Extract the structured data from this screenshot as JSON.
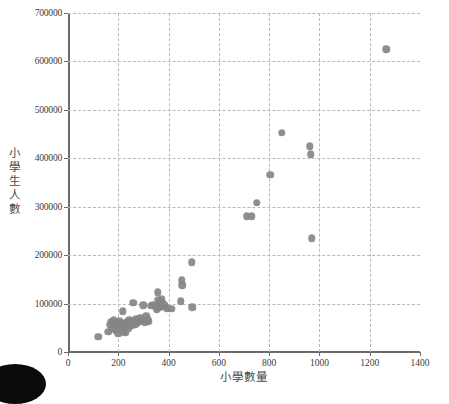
{
  "chart_data": {
    "type": "scatter",
    "title": "",
    "xlabel": "小學數量",
    "ylabel": "小學生人數",
    "xlim": [
      0,
      1400
    ],
    "ylim": [
      0,
      700000
    ],
    "grid": true,
    "legend": null,
    "marker_color": "#868686",
    "xticks": [
      "0",
      "200",
      "400",
      "600",
      "800",
      "1000",
      "1200",
      "1400"
    ],
    "xtick_values": [
      0,
      200,
      400,
      600,
      800,
      1000,
      1200,
      1400
    ],
    "yticks": [
      "0",
      "100000",
      "200000",
      "300000",
      "400000",
      "500000",
      "600000",
      "700000"
    ],
    "ytick_values": [
      0,
      100000,
      200000,
      300000,
      400000,
      500000,
      600000,
      700000
    ],
    "points": [
      [
        120,
        31000
      ],
      [
        160,
        42000
      ],
      [
        168,
        56000
      ],
      [
        172,
        62000
      ],
      [
        176,
        48000
      ],
      [
        180,
        58000
      ],
      [
        182,
        66000
      ],
      [
        186,
        52000
      ],
      [
        190,
        45000
      ],
      [
        194,
        60000
      ],
      [
        198,
        54000
      ],
      [
        200,
        38000
      ],
      [
        204,
        64000
      ],
      [
        206,
        50000
      ],
      [
        210,
        47000
      ],
      [
        212,
        59000
      ],
      [
        216,
        55000
      ],
      [
        218,
        84000
      ],
      [
        220,
        43000
      ],
      [
        224,
        51000
      ],
      [
        228,
        40000
      ],
      [
        232,
        57000
      ],
      [
        236,
        62000
      ],
      [
        240,
        49000
      ],
      [
        244,
        66000
      ],
      [
        248,
        58000
      ],
      [
        252,
        54000
      ],
      [
        256,
        61000
      ],
      [
        260,
        102000
      ],
      [
        264,
        64000
      ],
      [
        268,
        57000
      ],
      [
        272,
        69000
      ],
      [
        276,
        60000
      ],
      [
        282,
        63000
      ],
      [
        288,
        71000
      ],
      [
        292,
        66000
      ],
      [
        300,
        97000
      ],
      [
        306,
        60000
      ],
      [
        312,
        75000
      ],
      [
        316,
        68000
      ],
      [
        320,
        63000
      ],
      [
        330,
        95000
      ],
      [
        340,
        98000
      ],
      [
        348,
        94000
      ],
      [
        352,
        88000
      ],
      [
        356,
        123000
      ],
      [
        358,
        108000
      ],
      [
        360,
        100000
      ],
      [
        362,
        92000
      ],
      [
        366,
        104000
      ],
      [
        368,
        96000
      ],
      [
        372,
        110000
      ],
      [
        376,
        101000
      ],
      [
        380,
        93000
      ],
      [
        384,
        97000
      ],
      [
        392,
        90000
      ],
      [
        410,
        89000
      ],
      [
        448,
        105000
      ],
      [
        452,
        148000
      ],
      [
        454,
        138000
      ],
      [
        492,
        185000
      ],
      [
        494,
        92000
      ],
      [
        710,
        280000
      ],
      [
        730,
        280000
      ],
      [
        750,
        308000
      ],
      [
        805,
        366000
      ],
      [
        850,
        453000
      ],
      [
        962,
        425000
      ],
      [
        966,
        408000
      ],
      [
        970,
        235000
      ],
      [
        1265,
        625000
      ]
    ]
  }
}
